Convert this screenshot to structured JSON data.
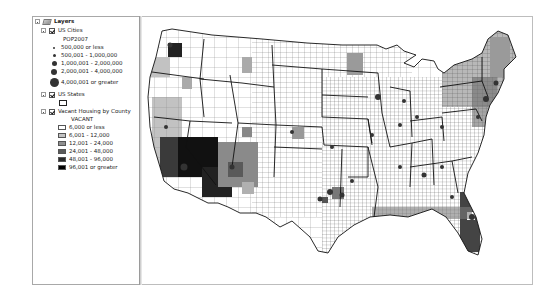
{
  "toc": {
    "root": {
      "label": "Layers",
      "icon": "layers-icon",
      "expanded": true
    },
    "layers": [
      {
        "label": "US Cities",
        "checked": true,
        "field": "POP2007",
        "classes": [
          {
            "label": "500,000 or less",
            "size": 2
          },
          {
            "label": "500,001 - 1,000,000",
            "size": 3
          },
          {
            "label": "1,000,001 - 2,000,000",
            "size": 5
          },
          {
            "label": "2,000,001 - 4,000,000",
            "size": 6
          },
          {
            "label": "4,000,001 or greater",
            "size": 9
          }
        ]
      },
      {
        "label": "US States",
        "checked": true
      },
      {
        "label": "Vacant Housing by County",
        "checked": true,
        "field": "VACANT",
        "classes": [
          {
            "label": "6,000 or less",
            "color": "#ffffff"
          },
          {
            "label": "6,001 - 12,000",
            "color": "#c2c2c2"
          },
          {
            "label": "12,001 - 24,000",
            "color": "#8f8f8f"
          },
          {
            "label": "24,001 - 48,000",
            "color": "#5a5a5a"
          },
          {
            "label": "48,001 - 96,000",
            "color": "#2a2a2a"
          },
          {
            "label": "96,001 or greater",
            "color": "#000000"
          }
        ]
      }
    ]
  },
  "map": {
    "description": "Choropleth map of contiguous United States showing vacant housing by county with city population symbols",
    "colors": {
      "county_outline": "#555555",
      "state_outline": "#111111",
      "background": "#ffffff"
    }
  }
}
